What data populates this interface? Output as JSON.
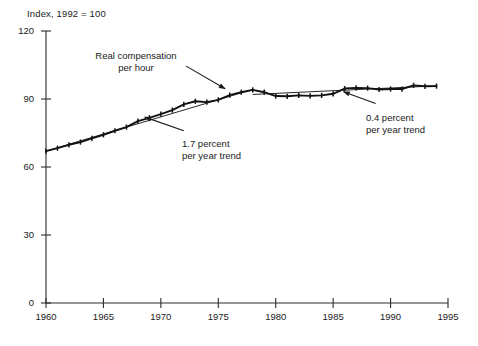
{
  "chart_data": {
    "type": "line",
    "title": "",
    "ylabel": "Index, 1992 = 100",
    "xlabel": "",
    "xlim": [
      1960,
      1995
    ],
    "ylim": [
      0,
      120
    ],
    "yticks": [
      0,
      30,
      60,
      90,
      120
    ],
    "xticks": [
      1960,
      1965,
      1970,
      1975,
      1980,
      1985,
      1990,
      1995
    ],
    "grid": false,
    "legend": "none",
    "series": [
      {
        "name": "Real compensation per hour",
        "marker": "small-tick",
        "x": [
          1960,
          1961,
          1962,
          1963,
          1964,
          1965,
          1966,
          1967,
          1968,
          1969,
          1970,
          1971,
          1972,
          1973,
          1974,
          1975,
          1976,
          1977,
          1978,
          1979,
          1980,
          1981,
          1982,
          1983,
          1984,
          1985,
          1986,
          1987,
          1988,
          1989,
          1990,
          1991,
          1992,
          1993,
          1994
        ],
        "values": [
          67.0,
          68.3,
          69.8,
          71.0,
          72.6,
          74.2,
          76.0,
          77.6,
          80.2,
          81.7,
          83.3,
          85.1,
          87.6,
          89.0,
          88.6,
          89.6,
          91.7,
          93.0,
          94.0,
          93.0,
          91.3,
          91.2,
          91.6,
          91.4,
          91.6,
          92.3,
          94.6,
          94.9,
          94.8,
          94.2,
          94.4,
          94.4,
          96.0,
          95.6,
          95.7
        ]
      },
      {
        "name": "1.7 percent per year trend",
        "kind": "trend-line",
        "rate_percent_per_year": 1.7,
        "x": [
          1960,
          1978
        ],
        "values": [
          67.0,
          94.2
        ]
      },
      {
        "name": "0.4 percent per year trend",
        "kind": "trend-line",
        "rate_percent_per_year": 0.4,
        "x": [
          1978,
          1994
        ],
        "values": [
          92.0,
          95.8
        ]
      }
    ],
    "annotations": [
      {
        "id": "real-compensation",
        "text": "Real compensation\nper hour",
        "align": "center",
        "arrow_from": [
          1972.2,
          104.5
        ],
        "arrow_to": [
          1975.6,
          94.5
        ]
      },
      {
        "id": "trend-17",
        "text": "1.7 percent\nper year trend",
        "align": "left",
        "arrow_from": [
          1972.0,
          76.0
        ],
        "arrow_to": [
          1968.6,
          82.0
        ]
      },
      {
        "id": "trend-04",
        "text": "0.4 percent\nper year trend",
        "align": "left",
        "arrow_from": [
          1988.7,
          88.0
        ],
        "arrow_to": [
          1985.9,
          93.2
        ]
      }
    ]
  },
  "axis": {
    "y_title": "Index, 1992 = 100",
    "y_tick_labels": [
      "120",
      "90",
      "60",
      "30",
      "0"
    ],
    "x_tick_labels": [
      "1960",
      "1965",
      "1970",
      "1975",
      "1980",
      "1985",
      "1990",
      "1995"
    ]
  },
  "annotations": {
    "real_compensation": "Real compensation\nper hour",
    "trend_17": "1.7 percent\nper year trend",
    "trend_04": "0.4 percent\nper year trend"
  },
  "colors": {
    "line": "#111111",
    "axis": "#2b2b2b",
    "text": "#1a1a1a",
    "background": "#ffffff"
  }
}
